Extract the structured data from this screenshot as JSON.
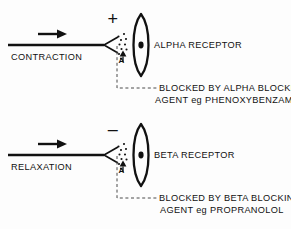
{
  "figure": {
    "title_visible": false,
    "background_color": "#fdfdfd",
    "ink_color": "#111111"
  },
  "panels": [
    {
      "id": "alpha",
      "pathway_label": "CONTRACTION",
      "sign_symbol": "+",
      "receptor_label": "ALPHA  RECEPTOR",
      "neurotransmitter_symbol": "A",
      "blocked_line1": "BLOCKED BY  ALPHA  BLOCKING",
      "blocked_line2": "AGENT  eg  PHENOXYBENZAMINE"
    },
    {
      "id": "beta",
      "pathway_label": "RELAXATION",
      "sign_symbol": "–",
      "receptor_label": "BETA  RECEPTOR",
      "neurotransmitter_symbol": "A",
      "blocked_line1": "BLOCKED BY BETA  BLOCKING",
      "blocked_line2": "AGENT  eg  PROPRANOLOL"
    }
  ]
}
